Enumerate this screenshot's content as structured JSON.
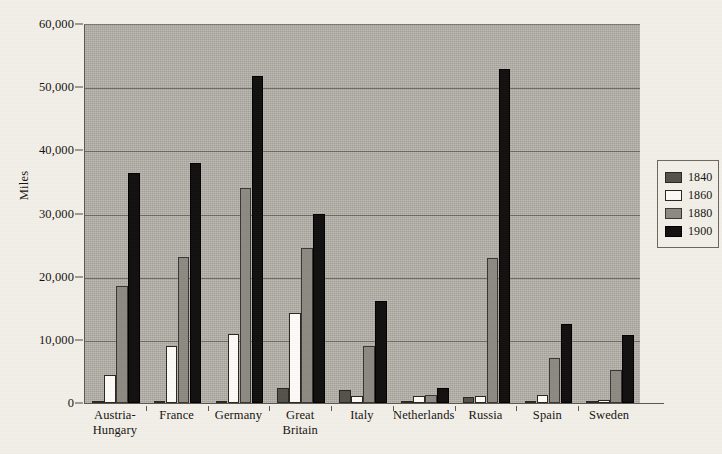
{
  "chart_data": {
    "type": "bar",
    "title": "",
    "xlabel": "",
    "ylabel": "Miles",
    "ylim": [
      0,
      60000
    ],
    "yticks": [
      "0",
      "10,000",
      "20,000",
      "30,000",
      "40,000",
      "50,000",
      "60,000"
    ],
    "ytick_values": [
      0,
      10000,
      20000,
      30000,
      40000,
      50000,
      60000
    ],
    "grid": true,
    "legend_position": "right",
    "categories": [
      "Austria-\nHungary",
      "France",
      "Germany",
      "Great\nBritain",
      "Italy",
      "Netherlands",
      "Russia",
      "Spain",
      "Sweden"
    ],
    "series": [
      {
        "name": "1840",
        "color": "#55514b",
        "values": [
          200,
          300,
          340,
          2400,
          2000,
          100,
          1000,
          100,
          0
        ]
      },
      {
        "name": "1860",
        "color": "#fbfaf6",
        "values": [
          4500,
          9100,
          11000,
          14200,
          1100,
          1100,
          1100,
          1200,
          400
        ]
      },
      {
        "name": "1880",
        "color": "#8d8a83",
        "values": [
          18500,
          23100,
          34000,
          24500,
          9100,
          1300,
          22900,
          7100,
          5300
        ]
      },
      {
        "name": "1900",
        "color": "#131110",
        "values": [
          36400,
          38000,
          51800,
          29900,
          16100,
          2300,
          52900,
          12500,
          10800
        ]
      }
    ]
  },
  "legend": {
    "entries": [
      {
        "label": "1840"
      },
      {
        "label": "1860"
      },
      {
        "label": "1880"
      },
      {
        "label": "1900"
      }
    ]
  },
  "colors": {
    "plot_background": "#b4b1aa",
    "page_background": "#f2efe9",
    "axis": "#5c574f",
    "gridline": "#6f6a62",
    "text": "#16130f"
  }
}
